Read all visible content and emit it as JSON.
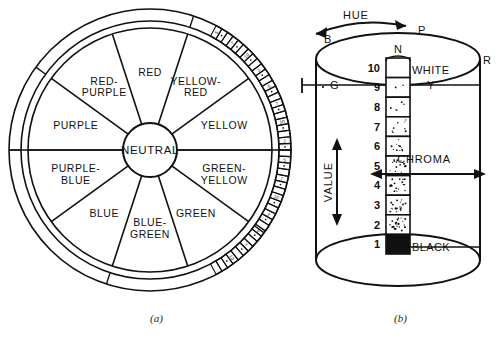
{
  "figure": {
    "caption_a": "(a)",
    "caption_b": "(b)"
  },
  "color_wheel": {
    "center_label": "NEUTRAL",
    "sectors": [
      {
        "label": "RED",
        "angle_deg": 90
      },
      {
        "label": "YELLOW-RED",
        "angle_deg": 54
      },
      {
        "label": "YELLOW",
        "angle_deg": 18
      },
      {
        "label": "GREEN-YELLOW",
        "angle_deg": -18
      },
      {
        "label": "GREEN",
        "angle_deg": -54
      },
      {
        "label": "BLUE-GREEN",
        "angle_deg": -90
      },
      {
        "label": "BLUE",
        "angle_deg": -126
      },
      {
        "label": "PURPLE-BLUE",
        "angle_deg": -162
      },
      {
        "label": "PURPLE",
        "angle_deg": 162
      },
      {
        "label": "RED-PURPLE",
        "angle_deg": 126
      }
    ],
    "outer_scale_numbers": [
      "5",
      "7",
      "10",
      "2",
      "5",
      "7",
      "10",
      "2",
      "5",
      "7",
      "10",
      "2",
      "5",
      "7",
      "10"
    ],
    "outer_scale_tick_count": 46
  },
  "color_solid": {
    "hue_label": "HUE",
    "value_label": "VALUE",
    "chroma_label": "CHROMA",
    "top_labels": {
      "back_left": "B",
      "purple": "P",
      "neutral_axis": "N",
      "red": "R",
      "green": "G",
      "yellow": "Y"
    },
    "white_label": "WHITE",
    "black_label": "BLACK",
    "value_scale": [
      "10",
      "9",
      "8",
      "7",
      "6",
      "5",
      "4",
      "3",
      "2",
      "1"
    ]
  }
}
